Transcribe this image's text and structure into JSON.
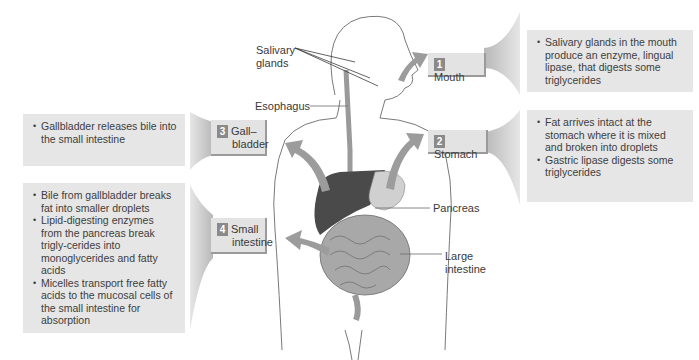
{
  "figure": {
    "steps": [
      {
        "number": "1",
        "label": "Mouth",
        "bullets": [
          "Salivary glands in the mouth produce an enzyme, lingual lipase, that digests some triglycerides"
        ]
      },
      {
        "number": "2",
        "label": "Stomach",
        "bullets": [
          "Fat arrives intact at the stomach where it is mixed and broken into droplets",
          "Gastric lipase digests some triglycerides"
        ]
      },
      {
        "number": "3",
        "label_line1": "Gall–",
        "label_line2": "bladder",
        "bullets": [
          "Gallbladder releases bile into the small intestine"
        ]
      },
      {
        "number": "4",
        "label_line1": "Small",
        "label_line2": "intestine",
        "bullets": [
          "Bile from gallbladder breaks fat into smaller droplets",
          "Lipid-digesting enzymes from the pancreas break trigly-cerides into monoglycerides and fatty acids",
          "Micelles transport free fatty acids to the mucosal cells of the small intestine for absorption"
        ]
      }
    ],
    "anatomy_labels": {
      "salivary_line1": "Salivary",
      "salivary_line2": "glands",
      "esophagus": "Esophagus",
      "pancreas": "Pancreas",
      "large_intestine_line1": "Large",
      "large_intestine_line2": "intestine"
    },
    "colors": {
      "box_fill": "#e6e6e6",
      "step_fill": "#e3e3e3",
      "badge": "#8a8a8a",
      "arrow": "#9c9c9c",
      "organ_dark": "#4a4a4a"
    }
  }
}
